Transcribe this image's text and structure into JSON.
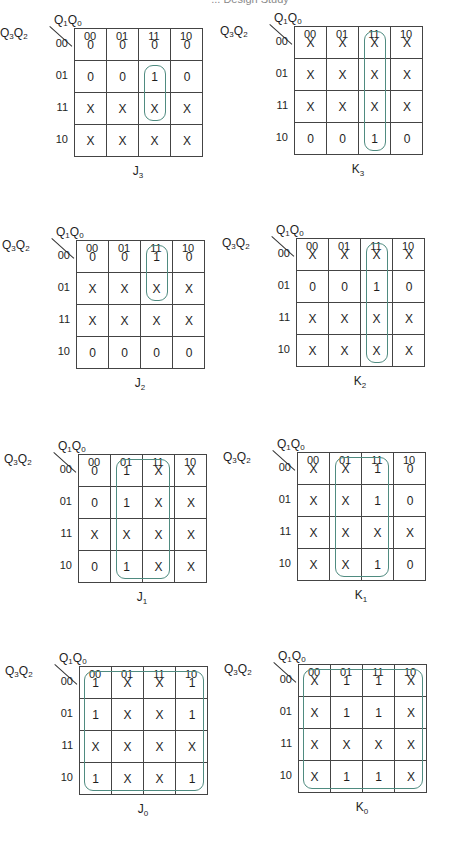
{
  "page": {
    "header_text": "... Design Study"
  },
  "axis": {
    "col_var": "Q1Q0",
    "row_var": "Q3Q2",
    "col_labels": [
      "00",
      "01",
      "11",
      "10"
    ],
    "row_labels": [
      "00",
      "01",
      "11",
      "10"
    ]
  },
  "colors": {
    "loop": "#4f8b80",
    "grid": "#444444",
    "text": "#1e1e1e"
  },
  "maps": [
    {
      "id": "J3",
      "name": "J",
      "sub": "3",
      "cells": [
        [
          "0",
          "0",
          "0",
          "0"
        ],
        [
          "0",
          "0",
          "1",
          "0"
        ],
        [
          "X",
          "X",
          "X",
          "X"
        ],
        [
          "X",
          "X",
          "X",
          "X"
        ]
      ],
      "loops": [
        {
          "col_start": 2,
          "col_end": 2,
          "row_start": 1,
          "row_end": 2
        }
      ]
    },
    {
      "id": "K3",
      "name": "K",
      "sub": "3",
      "cells": [
        [
          "X",
          "X",
          "X",
          "X"
        ],
        [
          "X",
          "X",
          "X",
          "X"
        ],
        [
          "X",
          "X",
          "X",
          "X"
        ],
        [
          "0",
          "0",
          "1",
          "0"
        ]
      ],
      "loops": [
        {
          "col_start": 2,
          "col_end": 2,
          "row_start": 0,
          "row_end": 3
        }
      ]
    },
    {
      "id": "J2",
      "name": "J",
      "sub": "2",
      "cells": [
        [
          "0",
          "0",
          "1",
          "0"
        ],
        [
          "X",
          "X",
          "X",
          "X"
        ],
        [
          "X",
          "X",
          "X",
          "X"
        ],
        [
          "0",
          "0",
          "0",
          "0"
        ]
      ],
      "loops": [
        {
          "col_start": 2,
          "col_end": 2,
          "row_start": 0,
          "row_end": 1
        }
      ]
    },
    {
      "id": "K2",
      "name": "K",
      "sub": "2",
      "cells": [
        [
          "X",
          "X",
          "X",
          "X"
        ],
        [
          "0",
          "0",
          "1",
          "0"
        ],
        [
          "X",
          "X",
          "X",
          "X"
        ],
        [
          "X",
          "X",
          "X",
          "X"
        ]
      ],
      "loops": [
        {
          "col_start": 2,
          "col_end": 2,
          "row_start": 0,
          "row_end": 3
        }
      ]
    },
    {
      "id": "J1",
      "name": "J",
      "sub": "1",
      "cells": [
        [
          "0",
          "1",
          "X",
          "X"
        ],
        [
          "0",
          "1",
          "X",
          "X"
        ],
        [
          "X",
          "X",
          "X",
          "X"
        ],
        [
          "0",
          "1",
          "X",
          "X"
        ]
      ],
      "loops": [
        {
          "col_start": 1,
          "col_end": 2,
          "row_start": 0,
          "row_end": 3
        }
      ]
    },
    {
      "id": "K1",
      "name": "K",
      "sub": "1",
      "cells": [
        [
          "X",
          "X",
          "1",
          "0"
        ],
        [
          "X",
          "X",
          "1",
          "0"
        ],
        [
          "X",
          "X",
          "X",
          "X"
        ],
        [
          "X",
          "X",
          "1",
          "0"
        ]
      ],
      "loops": [
        {
          "col_start": 1,
          "col_end": 2,
          "row_start": 0,
          "row_end": 3
        }
      ]
    },
    {
      "id": "J0",
      "name": "J",
      "sub": "0",
      "cells": [
        [
          "1",
          "X",
          "X",
          "1"
        ],
        [
          "1",
          "X",
          "X",
          "1"
        ],
        [
          "X",
          "X",
          "X",
          "X"
        ],
        [
          "1",
          "X",
          "X",
          "1"
        ]
      ],
      "loops": [
        {
          "col_start": 0,
          "col_end": 3,
          "row_start": 0,
          "row_end": 3
        }
      ]
    },
    {
      "id": "K0",
      "name": "K",
      "sub": "0",
      "cells": [
        [
          "X",
          "1",
          "1",
          "X"
        ],
        [
          "X",
          "1",
          "1",
          "X"
        ],
        [
          "X",
          "X",
          "X",
          "X"
        ],
        [
          "X",
          "1",
          "1",
          "X"
        ]
      ],
      "loops": [
        {
          "col_start": 0,
          "col_end": 3,
          "row_start": 0,
          "row_end": 3
        }
      ]
    }
  ]
}
